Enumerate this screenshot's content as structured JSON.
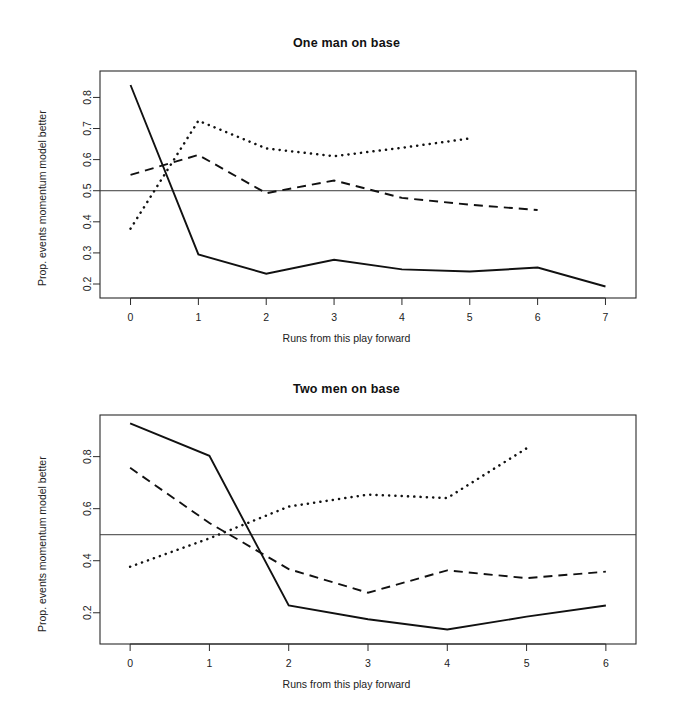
{
  "figure": {
    "background": "#ffffff",
    "ink_color": "#111111",
    "reference_line_value": 0.5
  },
  "chart_data": [
    {
      "type": "line",
      "title": "One man on base",
      "xlabel": "Runs from this play forward",
      "ylabel": "Prop. events momentum model better",
      "xlim": [
        -0.45,
        7.45
      ],
      "ylim": [
        0.155,
        0.885
      ],
      "xticks": [
        0,
        1,
        2,
        3,
        4,
        5,
        6,
        7
      ],
      "xticklabels": [
        "0",
        "1",
        "2",
        "3",
        "4",
        "5",
        "6",
        "7"
      ],
      "yticks": [
        0.2,
        0.3,
        0.4,
        0.5,
        0.6,
        0.7,
        0.8
      ],
      "yticklabels": [
        "0.2",
        "0.3",
        "0.4",
        "0.5",
        "0.6",
        "0.7",
        "0.8"
      ],
      "grid": false,
      "legend": "none",
      "reference_line": 0.5,
      "annotations": [],
      "series": [
        {
          "name": "solid",
          "style": "solid",
          "x": [
            0,
            1,
            2,
            3,
            4,
            5,
            6,
            7
          ],
          "values": [
            0.84,
            0.295,
            0.233,
            0.278,
            0.247,
            0.24,
            0.253,
            0.192
          ]
        },
        {
          "name": "dashed",
          "style": "dashed",
          "x": [
            0,
            1,
            2,
            3,
            4,
            5,
            6
          ],
          "values": [
            0.551,
            0.615,
            0.492,
            0.533,
            0.477,
            0.455,
            0.438
          ]
        },
        {
          "name": "dotted",
          "style": "dotted",
          "x": [
            0,
            1,
            2,
            3,
            4,
            5
          ],
          "values": [
            0.378,
            0.725,
            0.636,
            0.611,
            0.638,
            0.668
          ]
        }
      ]
    },
    {
      "type": "line",
      "title": "Two men on base",
      "xlabel": "Runs from this play forward",
      "ylabel": "Prop. events momentum model better",
      "xlim": [
        -0.38,
        6.38
      ],
      "ylim": [
        0.08,
        0.96
      ],
      "xticks": [
        0,
        1,
        2,
        3,
        4,
        5,
        6
      ],
      "xticklabels": [
        "0",
        "1",
        "2",
        "3",
        "4",
        "5",
        "6"
      ],
      "yticks": [
        0.2,
        0.4,
        0.6,
        0.8
      ],
      "yticklabels": [
        "0.2",
        "0.4",
        "0.6",
        "0.8"
      ],
      "grid": false,
      "legend": "none",
      "reference_line": 0.5,
      "annotations": [],
      "series": [
        {
          "name": "solid",
          "style": "solid",
          "x": [
            0,
            1,
            2,
            3,
            4,
            5,
            6
          ],
          "values": [
            0.928,
            0.803,
            0.228,
            0.175,
            0.136,
            0.185,
            0.228
          ]
        },
        {
          "name": "dashed",
          "style": "dashed",
          "x": [
            0,
            1,
            2,
            3,
            4,
            5,
            6
          ],
          "values": [
            0.757,
            0.545,
            0.368,
            0.277,
            0.363,
            0.333,
            0.358
          ]
        },
        {
          "name": "dotted",
          "style": "dotted",
          "x": [
            0,
            1,
            2,
            3,
            4,
            5
          ],
          "values": [
            0.377,
            0.486,
            0.608,
            0.654,
            0.641,
            0.832
          ]
        }
      ]
    }
  ]
}
